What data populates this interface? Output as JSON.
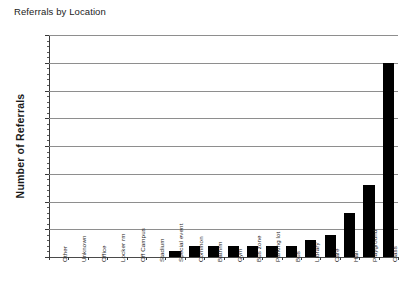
{
  "chart_data": {
    "type": "bar",
    "title": "Referrals by Location",
    "xlabel": "",
    "ylabel": "Number of Referrals",
    "ylim": [
      0,
      40
    ],
    "ytick_step": 5,
    "yticks": [
      0,
      5,
      10,
      15,
      20,
      25,
      30,
      35,
      40
    ],
    "grid": true,
    "legend": null,
    "bar_color": "#000000",
    "categories": [
      "Other",
      "Unknown",
      "Office",
      "Locker rm",
      "Off Campus",
      "Stadium",
      "Special event",
      "Common",
      "Bathrm",
      "Gym",
      "Bus zone",
      "Parking lot",
      "Bus",
      "Library",
      "Cafe",
      "Hall",
      "Playground",
      "Class"
    ],
    "values": [
      0,
      0,
      0,
      0,
      0,
      0,
      1,
      2,
      2,
      2,
      2,
      2,
      2,
      3,
      4,
      8,
      13,
      35
    ]
  }
}
